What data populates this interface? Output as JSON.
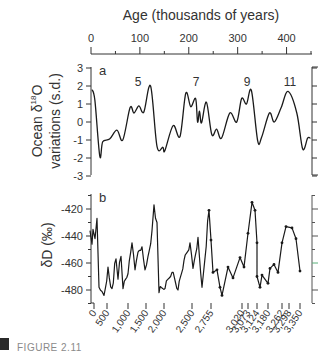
{
  "chart_data": [
    {
      "type": "line",
      "panel": "a",
      "title": "Age (thousands of years)",
      "xlabel": "Age (thousands of years)",
      "ylabel": "Ocean δ18O variations (s.d.)",
      "x_axis_position": "top",
      "x_ticks": [
        0,
        100,
        200,
        300,
        400
      ],
      "x_minor_ticks": [
        50,
        150,
        250,
        350,
        450
      ],
      "xlim": [
        0,
        450
      ],
      "y_ticks": [
        3,
        2,
        1,
        0,
        -1,
        -2,
        -3
      ],
      "ylim": [
        -3,
        3
      ],
      "annotations": [
        {
          "text": "5",
          "x": 125
        },
        {
          "text": "7",
          "x": 215
        },
        {
          "text": "9",
          "x": 320
        },
        {
          "text": "11",
          "x": 405
        }
      ],
      "series": [
        {
          "name": "Ocean δ18O",
          "x": [
            2,
            8,
            18,
            24,
            38,
            53,
            65,
            80,
            88,
            98,
            108,
            122,
            135,
            147,
            151,
            168,
            182,
            194,
            204,
            214,
            218,
            222,
            226,
            236,
            247,
            257,
            267,
            284,
            298,
            308,
            318,
            328,
            341,
            349,
            365,
            375,
            389,
            403,
            421,
            433,
            443,
            449
          ],
          "values": [
            1.8,
            1.2,
            -1.9,
            -1.1,
            -0.95,
            -0.45,
            -1.0,
            0.8,
            0.5,
            0.9,
            0.55,
            2.0,
            -1.35,
            -1.4,
            -1.6,
            -0.2,
            -0.8,
            1.6,
            0.85,
            1.3,
            0.0,
            0.6,
            -0.05,
            1.1,
            -0.7,
            -0.4,
            -0.9,
            0.5,
            0.0,
            1.3,
            1.0,
            1.75,
            -1.05,
            -0.85,
            0.5,
            0.0,
            0.8,
            1.7,
            0.5,
            -1.5,
            -0.9,
            -0.9
          ]
        }
      ]
    },
    {
      "type": "line",
      "panel": "b",
      "xlabel": "",
      "ylabel": "δD (‰)",
      "x_axis_position": "bottom",
      "x_ticks": [
        "0",
        "500",
        "1,000",
        "1,500",
        "2,000",
        "2,500",
        "2,755",
        "3,020",
        "3,073",
        "3,124",
        "3,180",
        "3,262",
        "3,298",
        "3,350"
      ],
      "y_ticks": [
        -420,
        -440,
        -460,
        -480
      ],
      "ylim": [
        -490,
        -410
      ],
      "annotations": [
        {
          "text": "b"
        }
      ],
      "series": [
        {
          "name": "δD",
          "x_px": [
            90,
            92,
            93,
            95,
            97,
            99,
            102,
            104,
            108,
            112,
            116,
            118,
            121,
            123,
            128,
            132,
            135,
            138,
            142,
            145,
            148,
            152,
            154,
            157,
            159,
            165,
            172,
            178,
            184,
            190,
            193,
            198,
            202,
            209,
            211,
            213,
            217,
            220,
            222,
            228,
            233,
            240,
            244,
            248,
            252,
            255,
            257,
            257,
            260,
            262,
            268,
            270,
            274,
            278,
            282,
            286,
            292,
            296,
            300
          ],
          "values": [
            -436,
            -446,
            -435,
            -442,
            -427,
            -478,
            -481,
            -484,
            -463,
            -479,
            -457,
            -472,
            -455,
            -479,
            -468,
            -445,
            -465,
            -452,
            -448,
            -465,
            -455,
            -436,
            -417,
            -430,
            -482,
            -479,
            -467,
            -480,
            -458,
            -445,
            -464,
            -441,
            -478,
            -421,
            -443,
            -467,
            -465,
            -478,
            -484,
            -463,
            -471,
            -456,
            -463,
            -438,
            -415,
            -421,
            -445,
            -470,
            -478,
            -469,
            -475,
            -464,
            -461,
            -467,
            -445,
            -433,
            -434,
            -442,
            -466
          ]
        }
      ]
    }
  ],
  "labels": {
    "top_axis_title": "Age (thousands of years)",
    "top_ticks": [
      "0",
      "100",
      "200",
      "300",
      "400"
    ],
    "panel_a": "a",
    "panel_b": "b",
    "ylabel_a_line1": "Ocean δ",
    "ylabel_a_sup": "18",
    "ylabel_a_o": "O",
    "ylabel_a_line2": "variations (s.d.)",
    "yticks_a": [
      "3",
      "2",
      "1",
      "0",
      "-1",
      "-2",
      "-3"
    ],
    "peaks": [
      "5",
      "7",
      "9",
      "11"
    ],
    "ylabel_b": "δD (‰)",
    "yticks_b": [
      "-420",
      "-440",
      "-460",
      "-480"
    ],
    "bottom_ticks": [
      "0",
      "500",
      "1,000",
      "1,500",
      "2,000",
      "2,500",
      "2,755",
      "3,020",
      "3,073",
      "3,124",
      "3,180",
      "3,262",
      "3,298",
      "3,350"
    ],
    "caption": "FIGURE 2.11"
  },
  "colors": {
    "line": "#1a1a1a",
    "axis": "#333333",
    "bottom_axis_left": "#b58cc0",
    "bottom_axis_right": "#8fd08a"
  }
}
